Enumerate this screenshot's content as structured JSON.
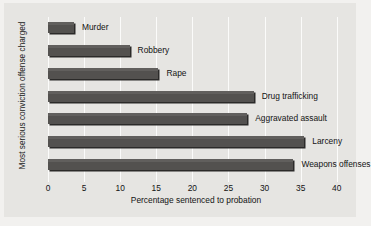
{
  "chart_data": {
    "type": "bar",
    "orientation": "horizontal",
    "title": "",
    "xlabel": "Percentage sentenced to probation",
    "ylabel": "Most serious conviction offense charged",
    "categories": [
      "Murder",
      "Robbery",
      "Rape",
      "Drug trafficking",
      "Aggravated assault",
      "Larceny",
      "Weapons offenses"
    ],
    "values": [
      3.6,
      11.3,
      15.3,
      28.5,
      27.6,
      35.5,
      34.0
    ],
    "xlim": [
      0,
      41
    ],
    "xticks": [
      0,
      5,
      10,
      15,
      20,
      25,
      30,
      35,
      40
    ],
    "xtick_labels": [
      "0",
      "5",
      "10",
      "15",
      "20",
      "25",
      "30",
      "35",
      "40"
    ],
    "grid": "vertical",
    "legend": "none",
    "bar_color": "#53514f",
    "bar_shadow_color": "#2b2a29",
    "gridline_color": "#fbfbfa",
    "plot_background": "#e6e5e2",
    "figure_background": "#f2f1ef",
    "text_color": "#131313"
  }
}
